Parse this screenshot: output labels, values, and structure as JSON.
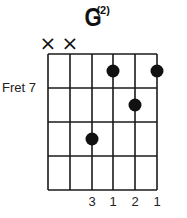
{
  "chord": {
    "name": "G",
    "superscript": "(2)",
    "fret_label": "Fret 7",
    "strings": 6,
    "frets_shown": 4,
    "starting_fret": 7,
    "muted_strings": [
      1,
      2
    ],
    "mute_symbol": "×",
    "dots": [
      {
        "string": 4,
        "fret": 1
      },
      {
        "string": 6,
        "fret": 1
      },
      {
        "string": 5,
        "fret": 2
      },
      {
        "string": 3,
        "fret": 3
      }
    ],
    "fingering": [
      "",
      "",
      "3",
      "1",
      "2",
      "1"
    ]
  },
  "colors": {
    "line": "#1a1a1a",
    "dot": "#111111",
    "background": "#ffffff"
  }
}
